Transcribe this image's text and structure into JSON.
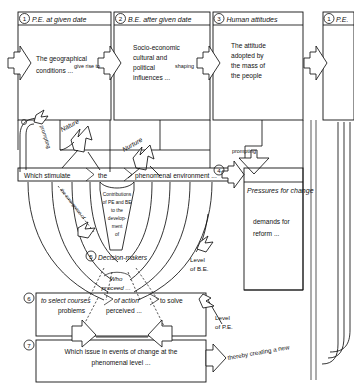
{
  "diagram": {
    "stages": [
      {
        "num": "1",
        "header": "P.E. at given date",
        "body_lines": [
          "The geographical",
          "conditions ..."
        ]
      },
      {
        "num": "2",
        "header": "B.E. after given date",
        "body_lines": [
          "Socio-economic",
          "cultural and",
          "political",
          "influences ..."
        ]
      },
      {
        "num": "3",
        "header": "Human attitudes",
        "body_lines": [
          "The attitude",
          "adopted by",
          "the mass of",
          "the people"
        ]
      },
      {
        "num": "4",
        "header": "Pressures for change",
        "body_lines": [
          "demands for",
          "reform ..."
        ]
      },
      {
        "num": "5",
        "header": "Decision-makers",
        "body_lines": [
          "Who",
          "proceed ..."
        ]
      },
      {
        "num": "6",
        "header": "",
        "body_lines": [
          "to select courses",
          "of action",
          "to solve",
          "problems",
          "perceived ..."
        ]
      },
      {
        "num": "7",
        "header": "",
        "body_lines": [
          "Which issue in events of change at the",
          "phenomenal level ..."
        ]
      }
    ],
    "repeat_stage": {
      "num": "1",
      "header": "P.E."
    },
    "connector_labels": [
      "give rise to",
      "shaping",
      "prompting",
      "prompting",
      "Nature",
      "Nurture",
      "the emergence of",
      "Level of B.E.",
      "Level of P.E.",
      "thereby creating a new"
    ],
    "band": {
      "segment_1": "Which stimulate",
      "segment_2": "the",
      "segment_3": "phenomenal environment ..."
    },
    "swirl_label_lines": [
      "Contributions",
      "of PE and BE",
      "to the",
      "develop-",
      "ment",
      "of"
    ],
    "box6": {
      "line_a": "to select courses",
      "line_b": "of action",
      "line_c": "to solve",
      "line_d": "problems",
      "line_e": "perceived ..."
    },
    "box7": {
      "line_a": "Which issue in events of change at the",
      "line_b": "phenomenal level ..."
    },
    "box4": {
      "title": "Pressures for change",
      "line_a": "demands for",
      "line_b": "reform ..."
    },
    "box5": {
      "title": "Decision-makers",
      "line_a": "Who",
      "line_b": "proceed ..."
    },
    "labels": {
      "nature": "Nature",
      "nurture": "Nurture",
      "prompting_left": "prompting",
      "prompting_right": "prompting",
      "emergence": "the emergence of",
      "level_be_a": "Level",
      "level_be_b": "of B.E.",
      "level_pe_a": "Level",
      "level_pe_b": "of P.E.",
      "thereby": "thereby creating a new",
      "give_rise_to": "give rise to",
      "shaping": "shaping"
    },
    "numbers": {
      "n1": "1",
      "n2": "2",
      "n3": "3",
      "n4": "4",
      "n5": "5",
      "n6": "6",
      "n7": "7",
      "n1b": "1"
    },
    "colors": {
      "stroke": "#111111",
      "background": "#ffffff",
      "fill": "#ffffff"
    }
  }
}
